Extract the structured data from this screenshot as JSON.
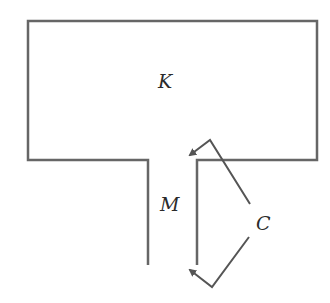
{
  "diagram": {
    "labels": {
      "chamber": "K",
      "channel": "M",
      "corners": "C"
    },
    "colors": {
      "line": "#555555",
      "text": "#2b2b2b",
      "background": "#ffffff"
    }
  }
}
